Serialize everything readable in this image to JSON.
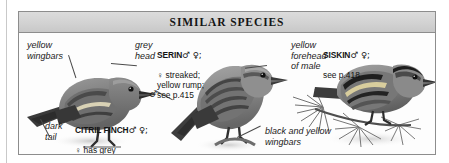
{
  "panel": {
    "header_title": "SIMILAR SPECIES",
    "border_color": "#8d8d8d",
    "header_bg": "#d2d2d2"
  },
  "annotations": [
    {
      "id": "yellow-wingbars",
      "text": "yellow\nwingbars"
    },
    {
      "id": "grey-head",
      "text": "grey\nhead"
    },
    {
      "id": "dark-tail",
      "text": "dark\ntail"
    },
    {
      "id": "yellow-forehead",
      "text": "yellow\nforehead\nof male"
    },
    {
      "id": "black-and-yellow-wingbars",
      "text": "black and yellow\nwingbars"
    }
  ],
  "species": [
    {
      "id": "citril-finch",
      "name": "CITRIL FINCH",
      "symbols": "♂ ♀;",
      "detail": "♀ has grey\nbreast; see p.416"
    },
    {
      "id": "serin",
      "name": "SERIN",
      "symbols": "♂ ♀;",
      "detail": "♀ streaked;\nyellow rump;\nsee p.415"
    },
    {
      "id": "siskin",
      "name": "SISKIN",
      "symbols": "♂ ♀;",
      "detail": "see p.418"
    }
  ],
  "lone_symbol": "♂"
}
